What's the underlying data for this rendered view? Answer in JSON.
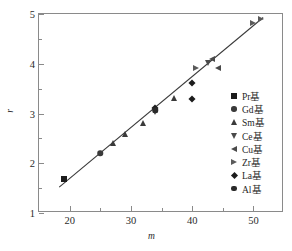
{
  "chart_data": {
    "type": "scatter",
    "title": "",
    "xlabel": "m",
    "ylabel": "r",
    "xlim": [
      15,
      55
    ],
    "ylim": [
      1,
      5
    ],
    "x_ticks": [
      "20",
      "30",
      "40",
      "50"
    ],
    "x_tick_values": [
      20,
      30,
      40,
      50
    ],
    "x_minor_values": [
      15,
      25,
      35,
      45,
      55
    ],
    "y_ticks": [
      "1",
      "2",
      "3",
      "4",
      "5"
    ],
    "y_tick_values": [
      1,
      2,
      3,
      4,
      5
    ],
    "y_minor_values": [
      1.5,
      2.5,
      3.5,
      4.5
    ],
    "grid": false,
    "legend_position": "right",
    "fit_line": {
      "label": "linear fit",
      "x": [
        18.3,
        51.6
      ],
      "y": [
        1.52,
        4.93
      ]
    },
    "series": [
      {
        "name": "Pr基",
        "marker": "square",
        "points": [
          {
            "x": 19.0,
            "y": 1.68
          }
        ]
      },
      {
        "name": "Gd基",
        "marker": "circle",
        "points": [
          {
            "x": 25.0,
            "y": 2.2
          }
        ]
      },
      {
        "name": "Sm基",
        "marker": "triangle-up",
        "points": [
          {
            "x": 27.0,
            "y": 2.4
          },
          {
            "x": 29.0,
            "y": 2.59
          },
          {
            "x": 32.0,
            "y": 2.81
          },
          {
            "x": 37.0,
            "y": 3.32
          }
        ]
      },
      {
        "name": "Ce基",
        "marker": "triangle-down",
        "points": [
          {
            "x": 34.0,
            "y": 3.04
          },
          {
            "x": 42.6,
            "y": 4.02
          }
        ]
      },
      {
        "name": "Cu基",
        "marker": "triangle-left",
        "points": [
          {
            "x": 43.2,
            "y": 4.1
          },
          {
            "x": 44.3,
            "y": 3.91
          }
        ]
      },
      {
        "name": "Zr基",
        "marker": "triangle-right",
        "points": [
          {
            "x": 40.6,
            "y": 3.92
          },
          {
            "x": 50.0,
            "y": 4.82
          },
          {
            "x": 51.2,
            "y": 4.9
          }
        ]
      },
      {
        "name": "La基",
        "marker": "diamond",
        "points": [
          {
            "x": 34.0,
            "y": 3.12
          },
          {
            "x": 40.0,
            "y": 3.61
          },
          {
            "x": 40.0,
            "y": 3.3
          }
        ]
      },
      {
        "name": "Al基",
        "marker": "hexagon",
        "points": [
          {
            "x": 34.0,
            "y": 3.07
          }
        ]
      }
    ]
  },
  "legend": {
    "items": [
      {
        "label": "Pr基",
        "marker": "square"
      },
      {
        "label": "Gd基",
        "marker": "circle"
      },
      {
        "label": "Sm基",
        "marker": "triangle-up"
      },
      {
        "label": "Ce基",
        "marker": "triangle-down"
      },
      {
        "label": "Cu基",
        "marker": "triangle-left"
      },
      {
        "label": "Zr基",
        "marker": "triangle-right"
      },
      {
        "label": "La基",
        "marker": "diamond"
      },
      {
        "label": "Al基",
        "marker": "hexagon"
      }
    ]
  },
  "colors": {
    "frame": "#8a8a8a",
    "marker": "#2a2a2a",
    "line": "#3a3a3a",
    "text": "#1f1f1f",
    "background": "#ffffff"
  }
}
